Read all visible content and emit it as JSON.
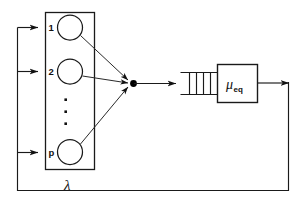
{
  "figure": {
    "background_color": "#ffffff",
    "line_color": "#1a1a1a",
    "canvas": {
      "width": 303,
      "height": 217
    }
  },
  "source_block": {
    "name": "source-population-box",
    "label_below": "λ",
    "nodes": [
      {
        "id": "node-1",
        "label": "1"
      },
      {
        "id": "node-2",
        "label": "2"
      },
      {
        "id": "node-p",
        "label": "p"
      }
    ],
    "ellipsis": "⋮",
    "ellipsis_dot_count": 3
  },
  "junction": {
    "name": "merge-junction",
    "style": "filled-dot"
  },
  "queue": {
    "name": "waiting-queue",
    "slot_count": 4,
    "open_side": "left"
  },
  "server": {
    "name": "equivalent-server",
    "symbol": "μ",
    "subscript": "eq"
  },
  "arrows": {
    "inbound_count": 3,
    "merge_to_queue": true,
    "server_output": true,
    "feedback_loop": true
  }
}
